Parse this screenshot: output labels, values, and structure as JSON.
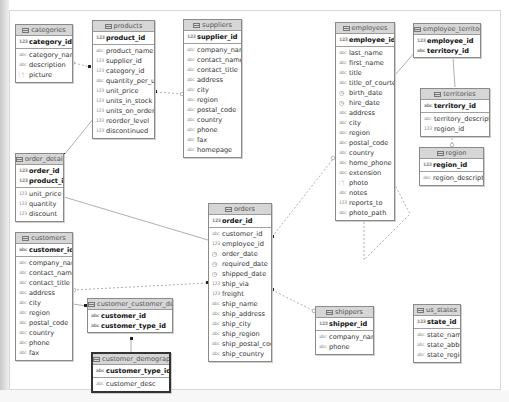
{
  "type_glyphs": {
    "num": "123",
    "text": "abc",
    "date": "◷",
    "blob": "🗋"
  },
  "entities": {
    "categories": {
      "title": "categories",
      "pk": [
        {
          "name": "category_id",
          "type": "123"
        }
      ],
      "cols": [
        {
          "name": "category_name",
          "type": "abc"
        },
        {
          "name": "description",
          "type": "abc"
        },
        {
          "name": "picture",
          "type": "🗋"
        }
      ]
    },
    "products": {
      "title": "products",
      "pk": [
        {
          "name": "product_id",
          "type": "123"
        }
      ],
      "cols": [
        {
          "name": "product_name",
          "type": "abc"
        },
        {
          "name": "supplier_id",
          "type": "123"
        },
        {
          "name": "category_id",
          "type": "123"
        },
        {
          "name": "quantity_per_unit",
          "type": "abc"
        },
        {
          "name": "unit_price",
          "type": "123"
        },
        {
          "name": "units_in_stock",
          "type": "123"
        },
        {
          "name": "units_on_order",
          "type": "123"
        },
        {
          "name": "reorder_level",
          "type": "123"
        },
        {
          "name": "discontinued",
          "type": "123"
        }
      ]
    },
    "suppliers": {
      "title": "suppliers",
      "pk": [
        {
          "name": "supplier_id",
          "type": "123"
        }
      ],
      "cols": [
        {
          "name": "company_name",
          "type": "abc"
        },
        {
          "name": "contact_name",
          "type": "abc"
        },
        {
          "name": "contact_title",
          "type": "abc"
        },
        {
          "name": "address",
          "type": "abc"
        },
        {
          "name": "city",
          "type": "abc"
        },
        {
          "name": "region",
          "type": "abc"
        },
        {
          "name": "postal_code",
          "type": "abc"
        },
        {
          "name": "country",
          "type": "abc"
        },
        {
          "name": "phone",
          "type": "abc"
        },
        {
          "name": "fax",
          "type": "abc"
        },
        {
          "name": "homepage",
          "type": "abc"
        }
      ]
    },
    "employees": {
      "title": "employees",
      "pk": [
        {
          "name": "employee_id",
          "type": "123"
        }
      ],
      "cols": [
        {
          "name": "last_name",
          "type": "abc"
        },
        {
          "name": "first_name",
          "type": "abc"
        },
        {
          "name": "title",
          "type": "abc"
        },
        {
          "name": "title_of_courtesy",
          "type": "abc"
        },
        {
          "name": "birth_date",
          "type": "◷"
        },
        {
          "name": "hire_date",
          "type": "◷"
        },
        {
          "name": "address",
          "type": "abc"
        },
        {
          "name": "city",
          "type": "abc"
        },
        {
          "name": "region",
          "type": "abc"
        },
        {
          "name": "postal_code",
          "type": "abc"
        },
        {
          "name": "country",
          "type": "abc"
        },
        {
          "name": "home_phone",
          "type": "abc"
        },
        {
          "name": "extension",
          "type": "abc"
        },
        {
          "name": "photo",
          "type": "🗋"
        },
        {
          "name": "notes",
          "type": "abc"
        },
        {
          "name": "reports_to",
          "type": "123"
        },
        {
          "name": "photo_path",
          "type": "abc"
        }
      ]
    },
    "employee_territories": {
      "title": "employee_territories",
      "pk": [
        {
          "name": "employee_id",
          "type": "123"
        },
        {
          "name": "territory_id",
          "type": "abc"
        }
      ],
      "cols": []
    },
    "territories": {
      "title": "territories",
      "pk": [
        {
          "name": "territory_id",
          "type": "abc"
        }
      ],
      "cols": [
        {
          "name": "territory_description",
          "type": "abc"
        },
        {
          "name": "region_id",
          "type": "123"
        }
      ]
    },
    "region": {
      "title": "region",
      "pk": [
        {
          "name": "region_id",
          "type": "123"
        }
      ],
      "cols": [
        {
          "name": "region_description",
          "type": "abc"
        }
      ]
    },
    "order_details": {
      "title": "order_details",
      "pk": [
        {
          "name": "order_id",
          "type": "123"
        },
        {
          "name": "product_id",
          "type": "123"
        }
      ],
      "cols": [
        {
          "name": "unit_price",
          "type": "123"
        },
        {
          "name": "quantity",
          "type": "123"
        },
        {
          "name": "discount",
          "type": "123"
        }
      ]
    },
    "orders": {
      "title": "orders",
      "pk": [
        {
          "name": "order_id",
          "type": "123"
        }
      ],
      "cols": [
        {
          "name": "customer_id",
          "type": "abc"
        },
        {
          "name": "employee_id",
          "type": "123"
        },
        {
          "name": "order_date",
          "type": "◷"
        },
        {
          "name": "required_date",
          "type": "◷"
        },
        {
          "name": "shipped_date",
          "type": "◷"
        },
        {
          "name": "ship_via",
          "type": "123"
        },
        {
          "name": "freight",
          "type": "123"
        },
        {
          "name": "ship_name",
          "type": "abc"
        },
        {
          "name": "ship_address",
          "type": "abc"
        },
        {
          "name": "ship_city",
          "type": "abc"
        },
        {
          "name": "ship_region",
          "type": "abc"
        },
        {
          "name": "ship_postal_code",
          "type": "abc"
        },
        {
          "name": "ship_country",
          "type": "abc"
        }
      ]
    },
    "customers": {
      "title": "customers",
      "pk": [
        {
          "name": "customer_id",
          "type": "abc"
        }
      ],
      "cols": [
        {
          "name": "company_name",
          "type": "abc"
        },
        {
          "name": "contact_name",
          "type": "abc"
        },
        {
          "name": "contact_title",
          "type": "abc"
        },
        {
          "name": "address",
          "type": "abc"
        },
        {
          "name": "city",
          "type": "abc"
        },
        {
          "name": "region",
          "type": "abc"
        },
        {
          "name": "postal_code",
          "type": "abc"
        },
        {
          "name": "country",
          "type": "abc"
        },
        {
          "name": "phone",
          "type": "abc"
        },
        {
          "name": "fax",
          "type": "abc"
        }
      ]
    },
    "customer_customer_demo": {
      "title": "customer_customer_demo",
      "pk": [
        {
          "name": "customer_id",
          "type": "abc"
        },
        {
          "name": "customer_type_id",
          "type": "abc"
        }
      ],
      "cols": []
    },
    "customer_demographics": {
      "title": "customer_demographics",
      "pk": [
        {
          "name": "customer_type_id",
          "type": "abc"
        }
      ],
      "cols": [
        {
          "name": "customer_desc",
          "type": "abc"
        }
      ]
    },
    "shippers": {
      "title": "shippers",
      "pk": [
        {
          "name": "shipper_id",
          "type": "123"
        }
      ],
      "cols": [
        {
          "name": "company_name",
          "type": "abc"
        },
        {
          "name": "phone",
          "type": "abc"
        }
      ]
    },
    "us_states": {
      "title": "us_states",
      "pk": [
        {
          "name": "state_id",
          "type": "123"
        }
      ],
      "cols": [
        {
          "name": "state_name",
          "type": "abc"
        },
        {
          "name": "state_abbr",
          "type": "abc"
        },
        {
          "name": "state_region",
          "type": "abc"
        }
      ]
    }
  },
  "colors": {
    "header_bg": "#d6d6d6",
    "border": "#8a8a8a",
    "link": "#999999",
    "canvas_bg": "#ffffff"
  }
}
